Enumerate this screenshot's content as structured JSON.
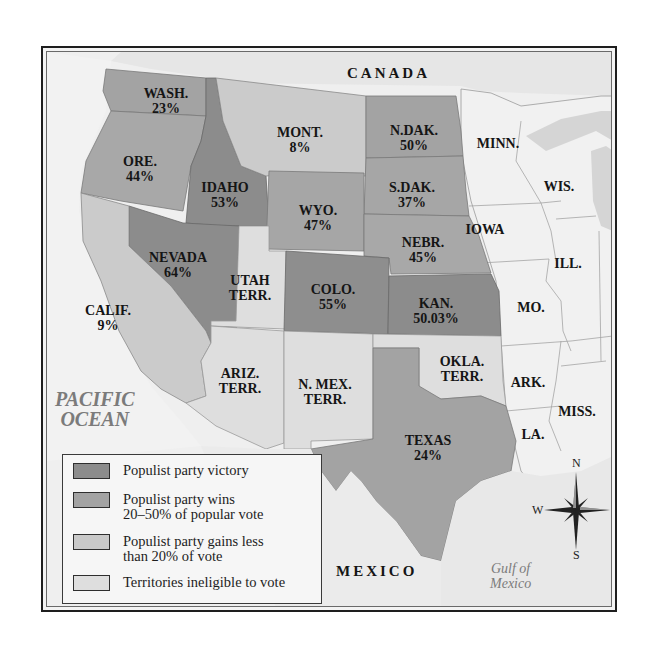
{
  "map": {
    "title_region_top": "CANADA",
    "title_region_bottom": "MEXICO",
    "water_bodies": {
      "pacific": [
        "PACIFIC",
        "OCEAN"
      ],
      "gulf": [
        "Gulf of",
        "Mexico"
      ]
    },
    "colors": {
      "victory": "#8c8c8c",
      "wins_20_50": "#a3a3a3",
      "less_20": "#c9c9c9",
      "territory": "#dedede",
      "non_western": "#f1f1f1",
      "background": "#eeeeee"
    },
    "states": [
      {
        "id": "wash",
        "name": "WASH.",
        "value": "23%",
        "category": "wins_20_50"
      },
      {
        "id": "ore",
        "name": "ORE.",
        "value": "44%",
        "category": "wins_20_50"
      },
      {
        "id": "idaho",
        "name": "IDAHO",
        "value": "53%",
        "category": "victory"
      },
      {
        "id": "mont",
        "name": "MONT.",
        "value": "8%",
        "category": "less_20"
      },
      {
        "id": "ndak",
        "name": "N.DAK.",
        "value": "50%",
        "category": "wins_20_50"
      },
      {
        "id": "sdak",
        "name": "S.DAK.",
        "value": "37%",
        "category": "wins_20_50"
      },
      {
        "id": "wyo",
        "name": "WYO.",
        "value": "47%",
        "category": "wins_20_50"
      },
      {
        "id": "nebr",
        "name": "NEBR.",
        "value": "45%",
        "category": "wins_20_50"
      },
      {
        "id": "nevada",
        "name": "NEVADA",
        "value": "64%",
        "category": "victory"
      },
      {
        "id": "utah",
        "name": "UTAH",
        "value": "TERR.",
        "category": "territory"
      },
      {
        "id": "colo",
        "name": "COLO.",
        "value": "55%",
        "category": "victory"
      },
      {
        "id": "kan",
        "name": "KAN.",
        "value": "50.03%",
        "category": "victory"
      },
      {
        "id": "calif",
        "name": "CALIF.",
        "value": "9%",
        "category": "less_20"
      },
      {
        "id": "ariz",
        "name": "ARIZ.",
        "value": "TERR.",
        "category": "territory"
      },
      {
        "id": "nmex",
        "name": "N. MEX.",
        "value": "TERR.",
        "category": "territory"
      },
      {
        "id": "okla",
        "name": "OKLA.",
        "value": "TERR.",
        "category": "territory"
      },
      {
        "id": "texas",
        "name": "TEXAS",
        "value": "24%",
        "category": "wins_20_50"
      }
    ],
    "other_states": [
      "MINN.",
      "WIS.",
      "IOWA",
      "ILL.",
      "MO.",
      "ARK.",
      "MISS.",
      "LA."
    ]
  },
  "legend": {
    "items": [
      {
        "label": "Populist party victory",
        "color": "#8c8c8c"
      },
      {
        "label": "Populist party wins\n20–50% of popular vote",
        "color": "#a3a3a3"
      },
      {
        "label": "Populist party gains less\nthan 20% of vote",
        "color": "#c9c9c9"
      },
      {
        "label": "Territories ineligible to vote",
        "color": "#dedede"
      }
    ]
  },
  "compass": {
    "n": "N",
    "s": "S",
    "e": "E",
    "w": "W"
  }
}
